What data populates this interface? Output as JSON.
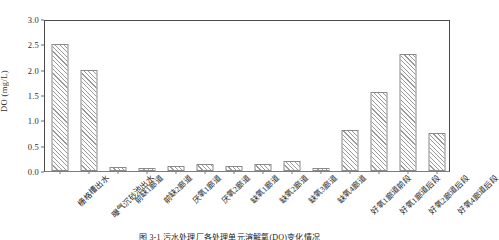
{
  "chart_data": {
    "type": "bar",
    "title": "",
    "xlabel": "",
    "ylabel": "DO (mg/L)",
    "ylim": [
      0.0,
      3.0
    ],
    "ytick_labels": [
      "0.0",
      "0.5",
      "1.0",
      "1.5",
      "2.0",
      "2.5",
      "3.0"
    ],
    "ytick_values": [
      0.0,
      0.5,
      1.0,
      1.5,
      2.0,
      2.5,
      3.0
    ],
    "grid": false,
    "legend": "none",
    "categories": [
      "栅格槽出水",
      "曝气沉砂池出水",
      "前缺1廊道",
      "前缺2廊道",
      "厌氧1廊道",
      "厌氧2廊道",
      "缺氧1廊道",
      "缺氧2廊道",
      "缺氧3廊道",
      "缺氧4廊道",
      "好氧1廊道前段",
      "好氧1廊道后段",
      "好氧2廊道后段",
      "好氧4廊道后段"
    ],
    "values": [
      2.5,
      2.0,
      0.07,
      0.06,
      0.09,
      0.13,
      0.1,
      0.13,
      0.2,
      0.05,
      0.8,
      1.55,
      2.3,
      0.75
    ],
    "series": [
      {
        "name": "DO",
        "values": [
          2.5,
          2.0,
          0.07,
          0.06,
          0.09,
          0.13,
          0.1,
          0.13,
          0.2,
          0.05,
          0.8,
          1.55,
          2.3,
          0.75
        ]
      }
    ]
  },
  "caption": {
    "text": "图 3-1  污水处理厂各处理单元溶解氧(DO)变化情况"
  }
}
